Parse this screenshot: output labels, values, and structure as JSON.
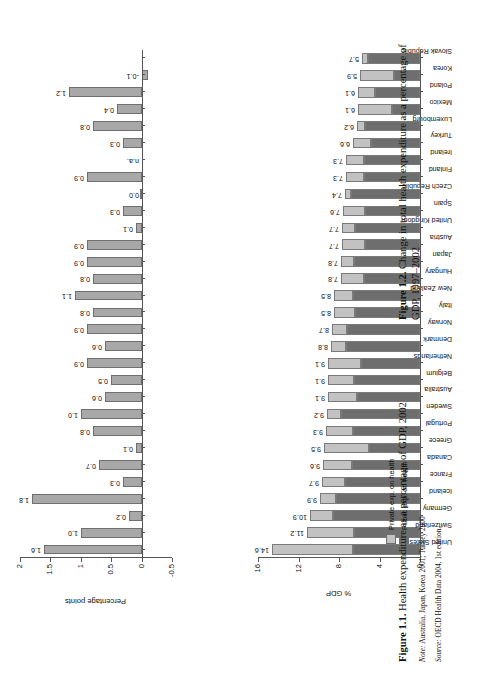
{
  "page": {
    "figure1": {
      "caption_label": "Figure 1.1.",
      "caption_text": "Health expenditure as a percentage of GDP, 2002",
      "note_label": "Note:",
      "note_text": "Australia, Japan, Korea 2001; Turkey 2000",
      "source_label": "Source:",
      "source_text": "OECD Health Data 2004, 1st edition.",
      "xlabel": "% GDP",
      "yticks": [
        "0",
        "4",
        "8",
        "12",
        "16"
      ],
      "ylim": [
        0,
        16
      ],
      "legend": [
        {
          "key": "private",
          "label": "Private exp. on health",
          "color": "#c2c2c2"
        },
        {
          "key": "public",
          "label": "Public exp. on health",
          "color": "#6e6e6e"
        }
      ]
    },
    "figure2": {
      "caption_label": "Figure 1.2.",
      "caption_text": "Change in total health expenditure as a percentage of GDP, 1997–2002",
      "xlabel": "Percentage points",
      "yticks": [
        "-0.5",
        "0",
        "0.5",
        "1",
        "1.5",
        "2"
      ],
      "ylim": [
        -0.5,
        2
      ]
    }
  },
  "chart_data": [
    {
      "type": "bar",
      "id": "fig-1-1",
      "title": "Health expenditure as a percentage of GDP, 2002",
      "xlabel": "",
      "ylabel": "% GDP",
      "ylim": [
        0,
        16
      ],
      "grid": false,
      "legend_position": "bottom-left",
      "stacked": true,
      "categories": [
        "United States",
        "Switzerland",
        "Germany",
        "Iceland",
        "France",
        "Canada",
        "Greece",
        "Portugal",
        "Sweden",
        "Australia",
        "Belgium",
        "Netherlands",
        "Denmark",
        "Norway",
        "Italy",
        "New Zealand",
        "Hungary",
        "Japan",
        "Austria",
        "United Kingdom",
        "Spain",
        "Czech Republic",
        "Finland",
        "Ireland",
        "Turkey",
        "Luxembourg",
        "Mexico",
        "Poland",
        "Korea",
        "Slovak Republic"
      ],
      "totals": [
        14.6,
        11.2,
        10.9,
        9.9,
        9.7,
        9.6,
        9.5,
        9.3,
        9.2,
        9.1,
        9.1,
        9.1,
        8.8,
        8.7,
        8.5,
        8.5,
        7.8,
        7.8,
        7.7,
        7.7,
        7.6,
        7.4,
        7.3,
        7.3,
        6.6,
        6.2,
        6.1,
        6.1,
        5.9,
        5.7
      ],
      "series": [
        {
          "name": "Public exp. on health",
          "color": "#6e6e6e",
          "values": [
            6.6,
            6.5,
            8.6,
            8.3,
            7.4,
            6.7,
            5.0,
            6.6,
            7.8,
            6.2,
            6.5,
            5.8,
            7.3,
            7.2,
            6.4,
            6.6,
            5.5,
            6.5,
            5.4,
            6.4,
            5.4,
            6.8,
            5.5,
            5.5,
            4.8,
            5.4,
            2.8,
            4.4,
            2.6,
            5.1
          ]
        },
        {
          "name": "Private exp. on health",
          "color": "#c2c2c2",
          "values": [
            8.0,
            4.7,
            2.3,
            1.6,
            2.3,
            2.9,
            4.5,
            2.7,
            1.4,
            2.9,
            2.6,
            3.3,
            1.5,
            1.5,
            2.1,
            1.9,
            2.3,
            1.3,
            2.3,
            1.3,
            2.2,
            0.6,
            1.8,
            1.8,
            1.8,
            0.8,
            3.3,
            1.7,
            3.3,
            0.6
          ]
        }
      ],
      "data_labels": [
        "14.6",
        "11.2",
        "10.9",
        "9.9",
        "9.7",
        "9.6",
        "9.5",
        "9.3",
        "9.2",
        "9.1",
        "9.1",
        "9.1",
        "8.8",
        "8.7",
        "8.5",
        "8.5",
        "7.8",
        "7.8",
        "7.7",
        "7.7",
        "7.6",
        "7.4",
        "7.3",
        "7.3",
        "6.6",
        "6.2",
        "6.1",
        "6.1",
        "5.9",
        "5.7"
      ]
    },
    {
      "type": "bar",
      "id": "fig-1-2",
      "title": "Change in total health expenditure as a percentage of GDP, 1997–2002",
      "xlabel": "",
      "ylabel": "Percentage points",
      "ylim": [
        -0.5,
        2
      ],
      "grid": false,
      "stacked": false,
      "categories": [
        "United States",
        "Switzerland",
        "Germany",
        "Iceland",
        "France",
        "Canada",
        "Greece",
        "Portugal",
        "Sweden",
        "Australia",
        "Belgium",
        "Netherlands",
        "Denmark",
        "Norway",
        "Italy",
        "New Zealand",
        "Hungary",
        "Japan",
        "Austria",
        "United Kingdom",
        "Spain",
        "Czech Republic",
        "Finland",
        "Ireland",
        "Turkey",
        "Luxembourg",
        "Mexico",
        "Poland",
        "Korea",
        "Slovak Republic"
      ],
      "values": [
        1.6,
        1.0,
        0.2,
        1.8,
        0.3,
        0.7,
        0.1,
        0.8,
        1.0,
        0.6,
        0.5,
        0.9,
        0.6,
        0.9,
        0.8,
        1.1,
        0.8,
        0.9,
        0.9,
        0.1,
        0.3,
        0.0,
        0.9,
        null,
        0.3,
        0.8,
        0.4,
        1.2,
        -0.1
      ],
      "data_labels": [
        "1.6",
        "1.0",
        "0.2",
        "1.8",
        "0.3",
        "0.7",
        "0.1",
        "0.8",
        "1.0",
        "0.6",
        "0.5",
        "0.9",
        "0.6",
        "0.9",
        "0.8",
        "1.1",
        "0.8",
        "0.9",
        "0.9",
        "0.1",
        "0.3",
        "0.0",
        "0.9",
        "n.a.",
        "0.3",
        "0.8",
        "0.4",
        "1.2",
        "-0.1"
      ],
      "na_label": "n.a."
    }
  ]
}
